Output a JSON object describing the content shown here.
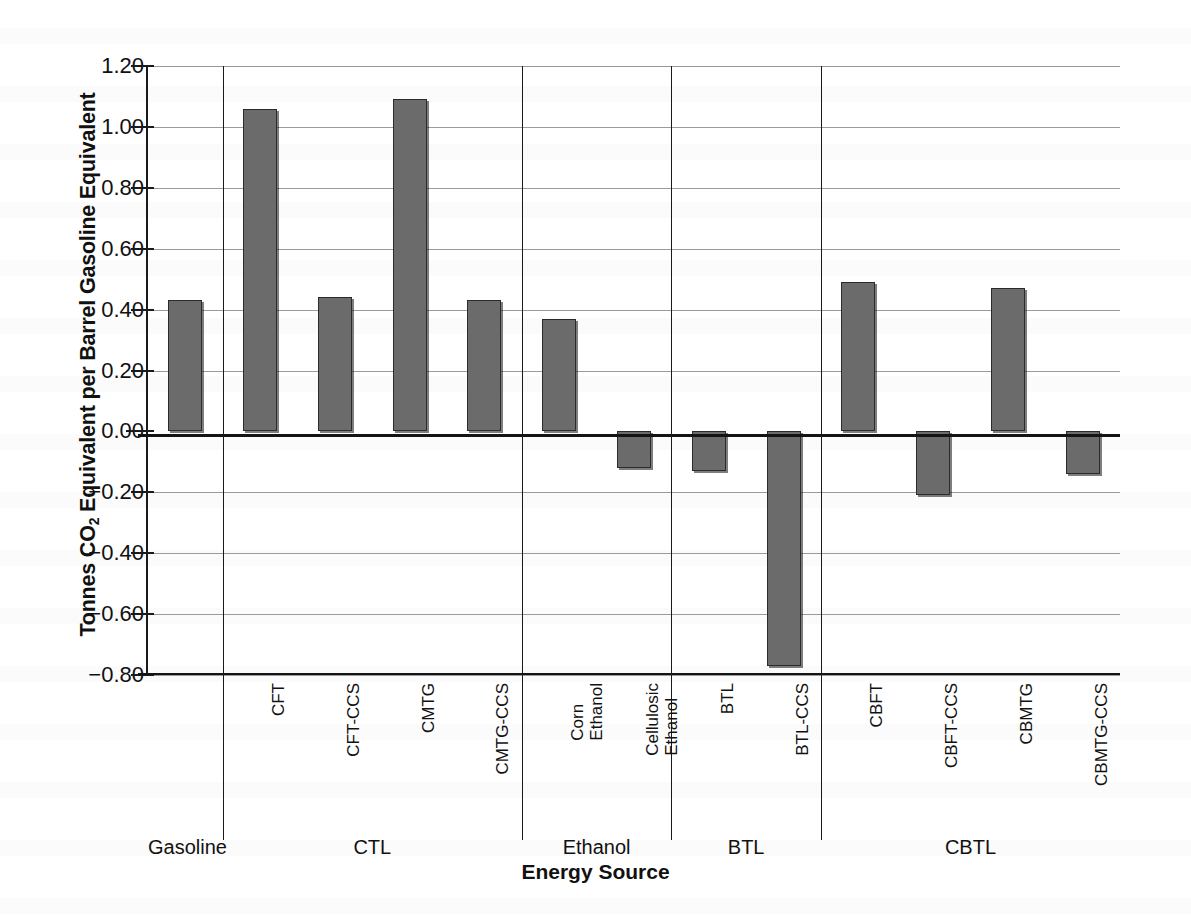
{
  "chart_data": {
    "type": "bar",
    "title": "",
    "xlabel": "Energy Source",
    "ylabel": "Tonnes CO2 Equivalent per Barrel Gasoline Equivalent",
    "ylabel_prefix": "Tonnes CO",
    "ylabel_sub": "2",
    "ylabel_suffix": " Equivalent per Barrel Gasoline Equivalent",
    "ylim": [
      -0.8,
      1.2
    ],
    "ytick_values": [
      1.2,
      1.0,
      0.8,
      0.6,
      0.4,
      0.2,
      0.0,
      -0.2,
      -0.4,
      -0.6,
      -0.8
    ],
    "ytick_labels": [
      "1.20",
      "1.00",
      "0.80",
      "0.60",
      "0.40",
      "0.20",
      "0.00",
      "−0.20",
      "−0.40",
      "−0.60",
      "−0.80"
    ],
    "grid": true,
    "legend": "none",
    "bar_color": "#6b6b6b",
    "bar_edge_color": "#2b2b2b",
    "categories": [
      "Gasoline",
      "CFT",
      "CFT-CCS",
      "CMTG",
      "CMTG-CCS",
      "Corn\nEthanol",
      "Cellulosic\nEthanol",
      "BTL",
      "BTL-CCS",
      "CBFT",
      "CBFT-CCS",
      "CBMTG",
      "CBMTG-CCS"
    ],
    "values": [
      0.43,
      1.06,
      0.44,
      1.09,
      0.43,
      0.37,
      -0.12,
      -0.13,
      -0.77,
      0.49,
      -0.21,
      0.47,
      -0.14
    ],
    "groups": [
      {
        "label": "Gasoline",
        "members": [
          "Gasoline"
        ]
      },
      {
        "label": "CTL",
        "members": [
          "CFT",
          "CFT-CCS",
          "CMTG",
          "CMTG-CCS"
        ]
      },
      {
        "label": "Ethanol",
        "members": [
          "Corn Ethanol",
          "Cellulosic Ethanol"
        ]
      },
      {
        "label": "BTL",
        "members": [
          "BTL",
          "BTL-CCS"
        ]
      },
      {
        "label": "CBTL",
        "members": [
          "CBFT",
          "CBFT-CCS",
          "CBMTG",
          "CBMTG-CCS"
        ]
      }
    ]
  }
}
